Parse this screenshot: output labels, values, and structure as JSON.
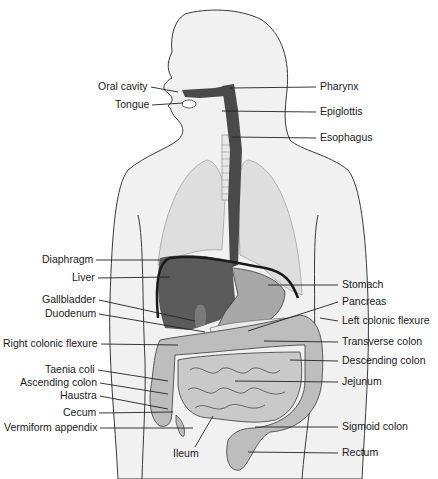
{
  "diagram": {
    "colors": {
      "background": "#ffffff",
      "body_fill": "#f1f1f1",
      "outline": "#3a3a3a",
      "lung_fill": "#dedede",
      "dark_organ": "#4a4a4a",
      "liver": "#5a5a5a",
      "stomach": "#a8a8a8",
      "intestine": "#bdbdbd",
      "leader_line": "#222222",
      "label_text": "#1a1a1a"
    },
    "labels_left": [
      {
        "id": "oral-cavity",
        "text": "Oral cavity",
        "x": 95,
        "y": 82,
        "tx": 178,
        "ty": 92
      },
      {
        "id": "tongue",
        "text": "Tongue",
        "x": 115,
        "y": 100,
        "tx": 183,
        "ty": 103
      },
      {
        "id": "diaphragm",
        "text": "Diaphragm",
        "x": 42,
        "y": 256,
        "tx": 160,
        "ty": 260
      },
      {
        "id": "liver",
        "text": "Liver",
        "x": 72,
        "y": 274,
        "tx": 170,
        "ty": 277
      },
      {
        "id": "gallbladder",
        "text": "Gallbladder",
        "x": 42,
        "y": 296,
        "tx": 195,
        "ty": 321
      },
      {
        "id": "duodenum",
        "text": "Duodenum",
        "x": 45,
        "y": 312,
        "tx": 205,
        "ty": 332
      },
      {
        "id": "right-colonic-flexure",
        "text": "Right colonic flexure",
        "x": 3,
        "y": 341,
        "tx": 178,
        "ty": 345
      },
      {
        "id": "taenia-coli",
        "text": "Taenia coli",
        "x": 45,
        "y": 377,
        "tx": 168,
        "ty": 381
      },
      {
        "id": "ascending-colon",
        "text": "Ascending colon",
        "x": 20,
        "y": 377,
        "tx": 168,
        "ty": 394,
        "row": 1
      },
      {
        "id": "haustra",
        "text": "Haustra",
        "x": 60,
        "y": 393,
        "tx": 168,
        "ty": 409
      },
      {
        "id": "cecum",
        "text": "Cecum",
        "x": 63,
        "y": 409,
        "tx": 173,
        "ty": 412
      },
      {
        "id": "vermiform-appendix",
        "text": "Vermiform appendix",
        "x": 4,
        "y": 425,
        "tx": 193,
        "ty": 428
      }
    ],
    "labels_right": [
      {
        "id": "pharynx",
        "text": "Pharynx",
        "x": 322,
        "y": 82,
        "tx": 230,
        "ty": 88
      },
      {
        "id": "epiglottis",
        "text": "Epiglottis",
        "x": 322,
        "y": 107,
        "tx": 222,
        "ty": 111
      },
      {
        "id": "esophagus",
        "text": "Esophagus",
        "x": 322,
        "y": 133,
        "tx": 232,
        "ty": 137
      },
      {
        "id": "stomach",
        "text": "Stomach",
        "x": 342,
        "y": 278,
        "tx": 268,
        "ty": 285
      },
      {
        "id": "pancreas",
        "text": "Pancreas",
        "x": 342,
        "y": 294,
        "tx": 248,
        "ty": 331
      },
      {
        "id": "left-colonic-flexure",
        "text": "Left colonic flexure",
        "x": 342,
        "y": 314,
        "tx": 320,
        "ty": 318
      },
      {
        "id": "transverse-colon",
        "text": "Transverse colon",
        "x": 342,
        "y": 334,
        "tx": 264,
        "ty": 341
      },
      {
        "id": "descending-colon",
        "text": "Descending colon",
        "x": 342,
        "y": 354,
        "tx": 290,
        "ty": 360
      },
      {
        "id": "jejunum",
        "text": "Jejunum",
        "x": 342,
        "y": 374,
        "tx": 235,
        "ty": 381
      },
      {
        "id": "sigmoid-colon",
        "text": "Sigmoid colon",
        "x": 342,
        "y": 423,
        "tx": 255,
        "ty": 427
      },
      {
        "id": "rectum",
        "text": "Rectum",
        "x": 342,
        "y": 448,
        "tx": 248,
        "ty": 452
      }
    ],
    "label_bottom": {
      "id": "ileum",
      "text": "Ileum",
      "x": 173,
      "y": 448,
      "tx": 213,
      "ty": 416
    }
  }
}
